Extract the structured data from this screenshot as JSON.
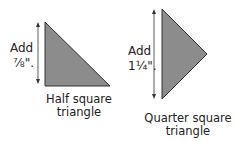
{
  "colors": {
    "triangle_fill": "#8c8c8c",
    "triangle_stroke": "#333333",
    "arrow": "#333333"
  },
  "half_square": {
    "add_label": "Add",
    "measurement": "⅞\".",
    "caption_line1": "Half square",
    "caption_line2": "triangle"
  },
  "quarter_square": {
    "add_label": "Add",
    "measurement": "1¼\".",
    "caption_line1": "Quarter square",
    "caption_line2": "triangle"
  }
}
